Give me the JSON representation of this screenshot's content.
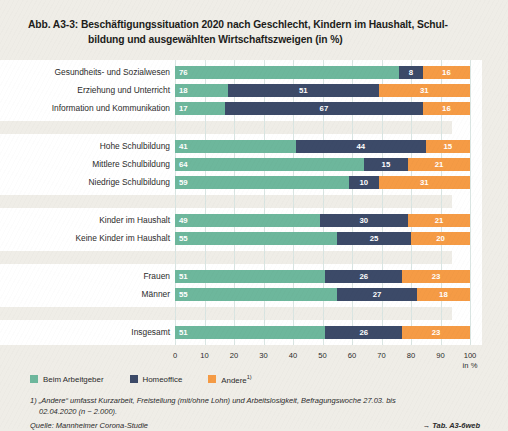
{
  "title": {
    "number": "Abb. A3-3:",
    "line1": "Beschäftigungssituation 2020 nach Geschlecht, Kindern im Haushalt, Schul-",
    "line2": "bildung und ausgewählten Wirtschaftszweigen (in %)"
  },
  "colors": {
    "beim_arbeitgeber": "#6DB79C",
    "homeoffice": "#3C4A68",
    "andere": "#F59B45",
    "page_background": "#EFEDE7",
    "plot_background": "#FFFFFF",
    "gridline": "#D9E5E2"
  },
  "legend": {
    "position": "bottom-left",
    "items": [
      {
        "label": "Beim Arbeitgeber",
        "color": "#6DB79C",
        "footnote_marker": ""
      },
      {
        "label": "Homeoffice",
        "color": "#3C4A68",
        "footnote_marker": ""
      },
      {
        "label": "Andere",
        "color": "#F59B45",
        "footnote_marker": "1)"
      }
    ]
  },
  "axis": {
    "ticks": [
      "0",
      "10",
      "20",
      "30",
      "40",
      "50",
      "60",
      "70",
      "80",
      "90",
      "100"
    ],
    "unit": "in %",
    "min": 0,
    "max": 100
  },
  "footnotes": {
    "note1_main": "1) „Andere“ umfasst Kurzarbeit, Freistellung (mit/ohne Lohn) und Arbeitslosigkeit, Befragungswoche 27.03. bis",
    "note1_cont": "02.04.2020 (n ~ 2.000).",
    "source": "Quelle: Mannheimer Corona-Studie",
    "table_ref": "→ Tab. A3-6web"
  },
  "chart_data": {
    "type": "bar",
    "orientation": "horizontal",
    "stacked": true,
    "xlabel": "in %",
    "ylabel": "",
    "xlim": [
      0,
      100
    ],
    "grid": true,
    "legend_position": "bottom-left",
    "series": [
      {
        "name": "Beim Arbeitgeber",
        "color": "#6DB79C"
      },
      {
        "name": "Homeoffice",
        "color": "#3C4A68"
      },
      {
        "name": "Andere",
        "color": "#F59B45"
      }
    ],
    "groups": [
      {
        "name": "Wirtschaftszweige",
        "categories": [
          {
            "label": "Gesundheits- und Sozialwesen",
            "values": [
              76,
              8,
              16
            ]
          },
          {
            "label": "Erziehung und Unterricht",
            "values": [
              18,
              51,
              31
            ]
          },
          {
            "label": "Information und Kommunikation",
            "values": [
              17,
              67,
              16
            ]
          }
        ]
      },
      {
        "name": "Schulbildung",
        "categories": [
          {
            "label": "Hohe Schulbildung",
            "values": [
              41,
              44,
              15
            ]
          },
          {
            "label": "Mittlere Schulbildung",
            "values": [
              64,
              15,
              21
            ]
          },
          {
            "label": "Niedrige Schulbildung",
            "values": [
              59,
              10,
              31
            ]
          }
        ]
      },
      {
        "name": "Kinder",
        "categories": [
          {
            "label": "Kinder im Haushalt",
            "values": [
              49,
              30,
              21
            ]
          },
          {
            "label": "Keine Kinder im Haushalt",
            "values": [
              55,
              25,
              20
            ]
          }
        ]
      },
      {
        "name": "Geschlecht",
        "categories": [
          {
            "label": "Frauen",
            "values": [
              51,
              26,
              23
            ]
          },
          {
            "label": "Männer",
            "values": [
              55,
              27,
              18
            ]
          }
        ]
      },
      {
        "name": "Insgesamt",
        "categories": [
          {
            "label": "Insgesamt",
            "values": [
              51,
              26,
              23
            ]
          }
        ]
      }
    ]
  }
}
